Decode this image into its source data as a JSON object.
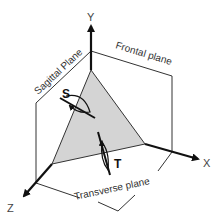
{
  "diagram": {
    "title": "",
    "axes": {
      "y": {
        "label": "Y"
      },
      "x": {
        "label": "X"
      },
      "z": {
        "label": "Z"
      }
    },
    "planes": {
      "sagittal": {
        "label": "Sagittal Plane"
      },
      "frontal": {
        "label": "Frontal plane"
      },
      "transverse": {
        "label": "Transverse plane"
      }
    },
    "rotations": {
      "s": {
        "label": "S"
      },
      "t": {
        "label": "T"
      }
    },
    "colors": {
      "line": "#333333",
      "axis": "#111111",
      "shaded_plane": "#d4d4d4",
      "background": "#ffffff"
    }
  }
}
